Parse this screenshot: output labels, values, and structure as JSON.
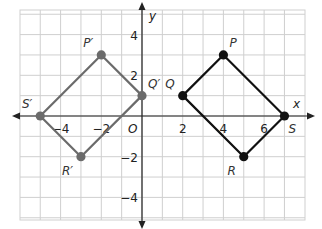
{
  "diagram": {
    "type": "coordinate-plane-translation",
    "axes": {
      "x_label": "x",
      "y_label": "y",
      "origin_label": "O",
      "x_range": [
        -6,
        8
      ],
      "y_range": [
        -5.2,
        5.2
      ],
      "x_ticks": [
        {
          "value": -4,
          "label": "−4"
        },
        {
          "value": -2,
          "label": "−2"
        },
        {
          "value": 2,
          "label": "2"
        },
        {
          "value": 4,
          "label": "4"
        },
        {
          "value": 6,
          "label": "6"
        }
      ],
      "y_ticks": [
        {
          "value": 4,
          "label": "4"
        },
        {
          "value": 2,
          "label": "2"
        },
        {
          "value": -2,
          "label": "−2"
        },
        {
          "value": -4,
          "label": "−4"
        }
      ]
    },
    "colors": {
      "grid": "#cfcfcf",
      "axis": "#222222",
      "preimage": "#111111",
      "image": "#6b6b6b"
    },
    "preimage": {
      "name": "PQRS",
      "points": [
        {
          "label": "P",
          "x": 4,
          "y": 3,
          "label_pos": "above-right"
        },
        {
          "label": "Q",
          "x": 2,
          "y": 1,
          "label_pos": "above-left"
        },
        {
          "label": "R",
          "x": 5,
          "y": -2,
          "label_pos": "below-left"
        },
        {
          "label": "S",
          "x": 7,
          "y": 0,
          "label_pos": "below-right"
        }
      ]
    },
    "image": {
      "name": "P'Q'R'S'",
      "points": [
        {
          "label": "P′",
          "x": -2,
          "y": 3,
          "label_pos": "above-left"
        },
        {
          "label": "Q′",
          "x": 0,
          "y": 1,
          "label_pos": "above-right"
        },
        {
          "label": "R′",
          "x": -3,
          "y": -2,
          "label_pos": "below-left"
        },
        {
          "label": "S′",
          "x": -5,
          "y": 0,
          "label_pos": "above-left"
        }
      ]
    }
  }
}
